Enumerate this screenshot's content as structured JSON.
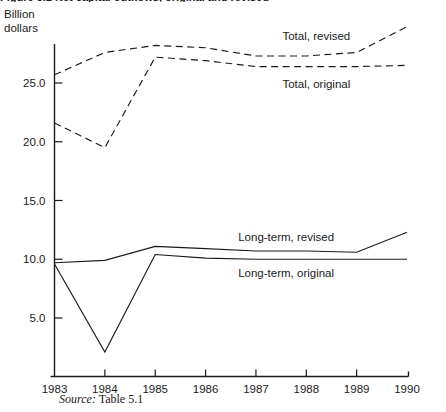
{
  "figure": {
    "title_partial": "Figure 5.1  Net capital outflows, original and revised",
    "y_axis_title": "Billion\ndollars",
    "source_prefix": "Source:",
    "source_text": "Table 5.1"
  },
  "chart_data": {
    "type": "line",
    "title": "",
    "xlabel": "",
    "ylabel": "Billion dollars",
    "x": [
      1983,
      1984,
      1985,
      1986,
      1987,
      1988,
      1989,
      1990
    ],
    "xtick_labels": [
      "1983",
      "1984",
      "1985",
      "1986",
      "1987",
      "1988",
      "1989",
      "1990"
    ],
    "ytick_labels": [
      "5.0",
      "10.0",
      "15.0",
      "20.0",
      "25.0"
    ],
    "ytick_values": [
      5.0,
      10.0,
      15.0,
      20.0,
      25.0
    ],
    "ylim": [
      0.0,
      30.8
    ],
    "xlim": [
      1983,
      1990
    ],
    "grid": false,
    "legend_position": "inline-right",
    "series": [
      {
        "name": "Total, revised",
        "style": "dashed",
        "label": "Total, revised",
        "label_x": 1988.2,
        "label_y": 29.0,
        "values": [
          25.7,
          27.6,
          28.2,
          28.0,
          27.3,
          27.3,
          27.6,
          29.8
        ]
      },
      {
        "name": "Total, original",
        "style": "dashed",
        "label": "Total, original",
        "label_x": 1988.2,
        "label_y": 24.9,
        "values": [
          21.6,
          19.5,
          27.2,
          26.9,
          26.4,
          26.4,
          26.4,
          26.5
        ]
      },
      {
        "name": "Long-term, revised",
        "style": "solid",
        "label": "Long-term, revised",
        "label_x": 1987.6,
        "label_y": 11.9,
        "values": [
          9.7,
          9.9,
          11.1,
          10.9,
          10.7,
          10.7,
          10.6,
          12.3
        ]
      },
      {
        "name": "Long-term, original",
        "style": "solid",
        "label": "Long-term, original",
        "label_x": 1987.6,
        "label_y": 8.8,
        "values": [
          9.6,
          2.1,
          10.4,
          10.1,
          10.0,
          10.0,
          10.0,
          10.0
        ]
      }
    ]
  }
}
